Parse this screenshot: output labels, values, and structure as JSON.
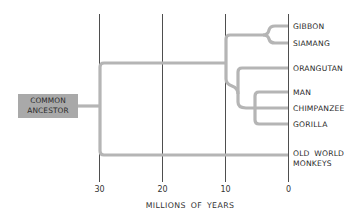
{
  "diagram": {
    "type": "phylogenetic-tree",
    "root": {
      "label_line1": "COMMON",
      "label_line2": "ANCESTOR"
    },
    "taxa": [
      {
        "name": "GIBBON"
      },
      {
        "name": "SIAMANG"
      },
      {
        "name": "ORANGUTAN"
      },
      {
        "name": "MAN"
      },
      {
        "name": "CHIMPANZEE"
      },
      {
        "name": "GORILLA"
      },
      {
        "name": "OLD WORLD",
        "name_line2": "MONKEYS"
      }
    ],
    "axis": {
      "ticks": [
        "30",
        "20",
        "10",
        "0"
      ],
      "title": "MILLIONS OF YEARS"
    },
    "colors": {
      "branch": "#b5b5b5",
      "gridline": "#3a3a3a",
      "ancestor_box": "#a9a9a9"
    }
  }
}
